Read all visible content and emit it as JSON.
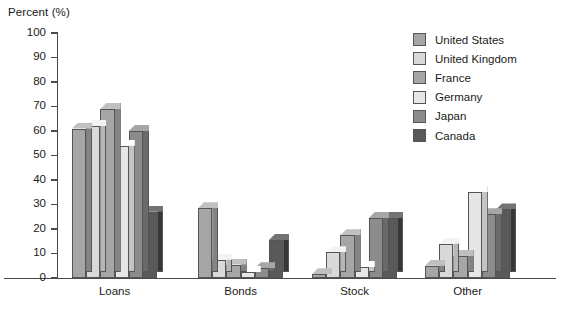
{
  "chart_data": {
    "type": "bar",
    "title": "",
    "xlabel": "",
    "ylabel": "Percent (%)",
    "ylim": [
      0,
      100
    ],
    "yticks": [
      0,
      10,
      20,
      30,
      40,
      50,
      60,
      70,
      80,
      90,
      100
    ],
    "grid": false,
    "legend_position": "top-right",
    "style": "3d-grouped-bar",
    "categories": [
      "Loans",
      "Bonds",
      "Stock",
      "Other"
    ],
    "series": [
      {
        "name": "United States",
        "color": "#a6a6a6",
        "values": [
          61,
          28.5,
          1.5,
          5
        ]
      },
      {
        "name": "United Kingdom",
        "color": "#d9d9d9",
        "values": [
          62,
          7.5,
          10.5,
          14
        ]
      },
      {
        "name": "France",
        "color": "#a6a6a6",
        "values": [
          69,
          5.5,
          17.5,
          9
        ]
      },
      {
        "name": "Germany",
        "color": "#e6e6e6",
        "values": [
          54,
          2.5,
          4.5,
          35
        ]
      },
      {
        "name": "Japan",
        "color": "#8c8c8c",
        "values": [
          60,
          4,
          24.5,
          26
        ]
      },
      {
        "name": "Canada",
        "color": "#595959",
        "values": [
          27,
          15.5,
          24.5,
          28
        ]
      }
    ]
  },
  "legend": {
    "items": [
      {
        "label": "United States"
      },
      {
        "label": "United Kingdom"
      },
      {
        "label": "France"
      },
      {
        "label": "Germany"
      },
      {
        "label": "Japan"
      },
      {
        "label": "Canada"
      }
    ]
  },
  "colors": {
    "axis": "#4a4a4a",
    "text": "#1a1a1a",
    "background": "#ffffff",
    "bar_outline": "#555555"
  }
}
